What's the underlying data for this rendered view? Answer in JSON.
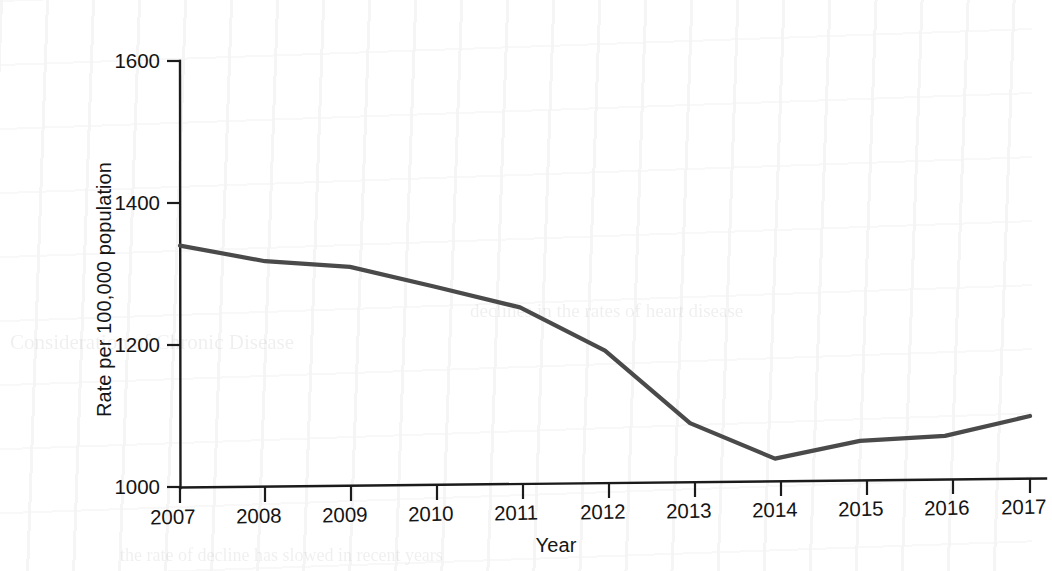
{
  "chart_data": {
    "type": "line",
    "title": "",
    "xlabel": "Year",
    "ylabel": "Rate per 100,000 population",
    "categories": [
      "2007",
      "2008",
      "2009",
      "2010",
      "2011",
      "2012",
      "2013",
      "2014",
      "2015",
      "2016",
      "2017"
    ],
    "x": [
      2007,
      2008,
      2009,
      2010,
      2011,
      2012,
      2013,
      2014,
      2015,
      2016,
      2017
    ],
    "values": [
      1340,
      1318,
      1310,
      1282,
      1253,
      1192,
      1090,
      1040,
      1065,
      1072,
      1100
    ],
    "series": [
      {
        "name": "Rate per 100,000 population",
        "values": [
          1340,
          1318,
          1310,
          1282,
          1253,
          1192,
          1090,
          1040,
          1065,
          1072,
          1100
        ]
      }
    ],
    "ylim": [
      1000,
      1600
    ],
    "xlim": [
      2007,
      2017
    ],
    "yticks": [
      1000,
      1200,
      1400,
      1600
    ],
    "ytick_labels": [
      "1000",
      "1200",
      "1400",
      "1600"
    ],
    "xtick_labels": [
      "2007",
      "2008",
      "2009",
      "2010",
      "2011",
      "2012",
      "2013",
      "2014",
      "2015",
      "2016",
      "2017"
    ],
    "grid": false,
    "legend": false,
    "legend_position": "none",
    "line_color": "#4a4a4a",
    "axis_color": "#1b1b1b",
    "markers": false
  },
  "figure": {
    "background_color": "#ffffff",
    "axis_color": "#1b1b1b",
    "text_color": "#141414"
  }
}
